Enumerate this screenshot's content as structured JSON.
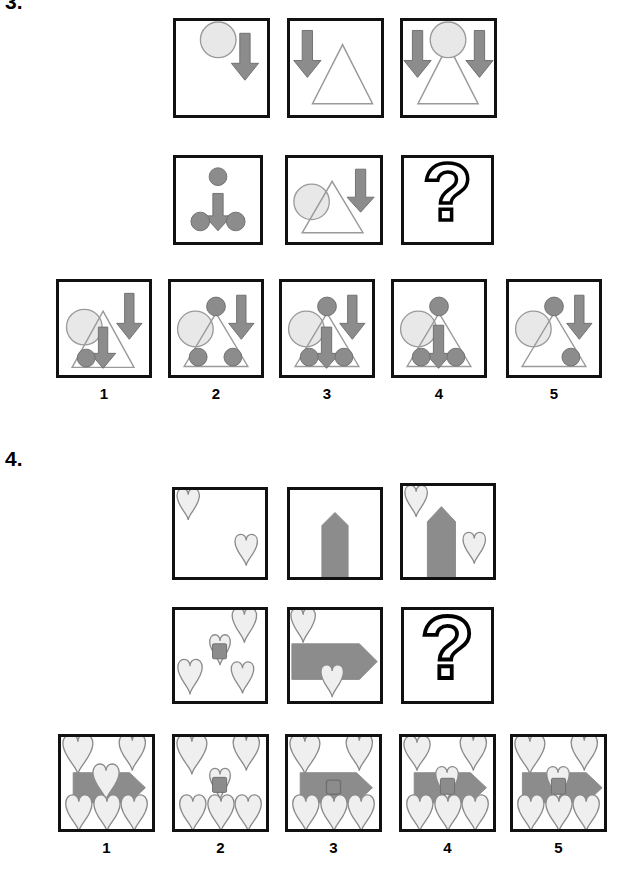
{
  "page": {
    "width": 619,
    "height": 870,
    "background": "#ffffff",
    "type": "non-verbal-reasoning-matrix-test"
  },
  "palette": {
    "frame_stroke": "#111111",
    "dark_gray_fill": "#8c8c8c",
    "dark_gray_stroke": "#6e6e6e",
    "light_gray_fill": "#e8e8e8",
    "light_gray_stroke": "#9a9a9a",
    "triangle_stroke": "#9a9a9a",
    "heart_fill": "#efefef",
    "heart_stroke": "#8a8a8a",
    "question_stroke": "#000000",
    "question_fill": "#ffffff",
    "text_color": "#000000"
  },
  "puzzles": [
    {
      "id": "puzzle-3",
      "label": "3.",
      "label_visible": true,
      "label_clipped_top": true,
      "theme": "circle-triangle-arrow",
      "matrix": {
        "rows": [
          {
            "row_index": 1,
            "cells": [
              {
                "cell_index": 1,
                "name": "matrix-cell-r1c1",
                "elements": [
                  "big-light-circle",
                  "down-arrow"
                ]
              },
              {
                "cell_index": 2,
                "name": "matrix-cell-r1c2",
                "elements": [
                  "down-arrow",
                  "triangle-outline"
                ]
              },
              {
                "cell_index": 3,
                "name": "matrix-cell-r1c3",
                "elements": [
                  "down-arrow",
                  "big-light-circle",
                  "triangle-outline",
                  "down-arrow"
                ]
              }
            ]
          },
          {
            "row_index": 2,
            "cells": [
              {
                "cell_index": 1,
                "name": "matrix-cell-r2c1",
                "elements": [
                  "small-dark-circle",
                  "down-arrow",
                  "small-dark-circle",
                  "small-dark-circle"
                ]
              },
              {
                "cell_index": 2,
                "name": "matrix-cell-r2c2",
                "elements": [
                  "big-light-circle",
                  "triangle-outline",
                  "down-arrow"
                ]
              },
              {
                "cell_index": 3,
                "name": "matrix-cell-r2c3-answer",
                "elements": [
                  "question-mark"
                ],
                "is_answer_slot": true,
                "question_mark": "?"
              }
            ]
          }
        ]
      },
      "options": [
        {
          "number": "1",
          "name": "option-1",
          "elements": [
            "big-light-circle",
            "triangle-outline",
            "down-arrow",
            "down-arrow",
            "small-dark-circle"
          ]
        },
        {
          "number": "2",
          "name": "option-2",
          "elements": [
            "big-light-circle",
            "triangle-outline",
            "small-dark-circle-top",
            "down-arrow",
            "small-dark-circle",
            "small-dark-circle"
          ]
        },
        {
          "number": "3",
          "name": "option-3",
          "elements": [
            "big-light-circle",
            "triangle-outline",
            "small-dark-circle-top",
            "down-arrow-right",
            "down-arrow-center",
            "small-dark-circle",
            "small-dark-circle"
          ]
        },
        {
          "number": "4",
          "name": "option-4",
          "elements": [
            "big-light-circle",
            "triangle-outline",
            "small-dark-circle-top",
            "down-arrow-center",
            "small-dark-circle",
            "small-dark-circle"
          ]
        },
        {
          "number": "5",
          "name": "option-5",
          "elements": [
            "big-light-circle",
            "triangle-outline",
            "small-dark-circle-top",
            "down-arrow-right",
            "small-dark-circle"
          ]
        }
      ]
    },
    {
      "id": "puzzle-4",
      "label": "4.",
      "label_visible": true,
      "label_clipped_top": false,
      "theme": "heart-pentagon-arrow",
      "matrix": {
        "rows": [
          {
            "row_index": 1,
            "cells": [
              {
                "cell_index": 1,
                "name": "matrix-cell-r1c1",
                "elements": [
                  "heart-top-left",
                  "heart-bottom-right"
                ]
              },
              {
                "cell_index": 2,
                "name": "matrix-cell-r1c2",
                "elements": [
                  "up-pentagon-arrow"
                ]
              },
              {
                "cell_index": 3,
                "name": "matrix-cell-r1c3",
                "elements": [
                  "heart-top-left",
                  "up-pentagon-arrow",
                  "heart-bottom-right"
                ]
              }
            ]
          },
          {
            "row_index": 2,
            "cells": [
              {
                "cell_index": 1,
                "name": "matrix-cell-r2c1",
                "elements": [
                  "heart-top-right",
                  "heart-center-with-square",
                  "heart-bottom-left",
                  "heart-bottom-right"
                ]
              },
              {
                "cell_index": 2,
                "name": "matrix-cell-r2c2",
                "elements": [
                  "heart-top-left",
                  "right-pentagon-arrow",
                  "heart-bottom-center"
                ]
              },
              {
                "cell_index": 3,
                "name": "matrix-cell-r2c3-answer",
                "elements": [
                  "question-mark"
                ],
                "is_answer_slot": true,
                "question_mark": "?"
              }
            ]
          }
        ]
      },
      "options": [
        {
          "number": "1",
          "name": "option-1",
          "elements": [
            "heart-top-left",
            "heart-top-right",
            "right-pentagon-arrow",
            "heart-on-arrow",
            "heart-bottom-row-3"
          ]
        },
        {
          "number": "2",
          "name": "option-2",
          "elements": [
            "heart-top-left",
            "heart-top-right",
            "heart-center-with-square",
            "heart-bottom-row-3"
          ]
        },
        {
          "number": "3",
          "name": "option-3",
          "elements": [
            "heart-top-left",
            "heart-top-right",
            "right-pentagon-arrow",
            "square-on-arrow",
            "heart-bottom-row-3"
          ]
        },
        {
          "number": "4",
          "name": "option-4",
          "elements": [
            "heart-top-left",
            "heart-top-right",
            "right-pentagon-arrow",
            "heart-with-square-on-arrow",
            "heart-bottom-row-3"
          ]
        },
        {
          "number": "5",
          "name": "option-5",
          "elements": [
            "heart-top-left",
            "heart-top-right",
            "right-pentagon-arrow-wide",
            "heart-with-square-on-arrow",
            "heart-bottom-row-3"
          ]
        }
      ]
    }
  ]
}
